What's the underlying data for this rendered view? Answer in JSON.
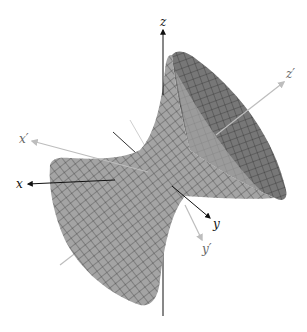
{
  "figure": {
    "surface": {
      "type": "hyperboloid-of-one-sheet",
      "fill_light": "#a4a4a4",
      "fill_dark": "#777777",
      "mesh_color": "#3a3a3a"
    },
    "axes": {
      "original": {
        "color": "#111111",
        "labels": {
          "x": "x",
          "y": "y",
          "z": "z"
        }
      },
      "rotated": {
        "color": "#bdbdbd",
        "labels": {
          "x": "x′",
          "y": "y′",
          "z": "z′"
        }
      }
    }
  }
}
